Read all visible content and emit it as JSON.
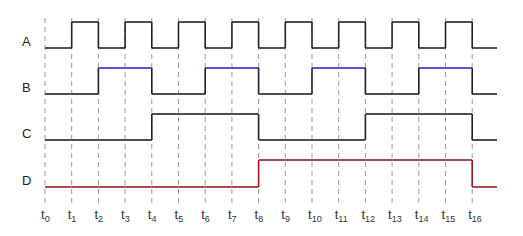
{
  "chart_data": {
    "type": "timing-diagram",
    "time_labels": [
      "t0",
      "t1",
      "t2",
      "t3",
      "t4",
      "t5",
      "t6",
      "t7",
      "t8",
      "t9",
      "t10",
      "t11",
      "t12",
      "t13",
      "t14",
      "t15",
      "t16"
    ],
    "signals": [
      {
        "name": "A",
        "color": "#222222",
        "high_color": "#222222",
        "levels": [
          0,
          1,
          0,
          1,
          0,
          1,
          0,
          1,
          0,
          1,
          0,
          1,
          0,
          1,
          0,
          1,
          0
        ]
      },
      {
        "name": "B",
        "color": "#222222",
        "high_color": "#2a2ad8",
        "levels": [
          0,
          0,
          1,
          1,
          0,
          0,
          1,
          1,
          0,
          0,
          1,
          1,
          0,
          0,
          1,
          1,
          0
        ]
      },
      {
        "name": "C",
        "color": "#222222",
        "high_color": "#222222",
        "levels": [
          0,
          0,
          0,
          0,
          1,
          1,
          1,
          1,
          0,
          0,
          0,
          0,
          1,
          1,
          1,
          1,
          0
        ]
      },
      {
        "name": "D",
        "color": "#9a1b25",
        "high_color": "#9a1b25",
        "levels": [
          0,
          0,
          0,
          0,
          0,
          0,
          0,
          0,
          1,
          1,
          1,
          1,
          1,
          1,
          1,
          1,
          0
        ]
      }
    ],
    "grid": "dashed vertical at each t",
    "grid_color": "#999999"
  }
}
